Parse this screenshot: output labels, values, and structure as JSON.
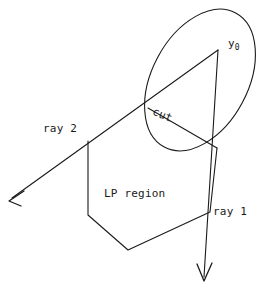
{
  "figure": {
    "background_color": "#ffffff",
    "ink_color": "#1a1a1a",
    "width": 273,
    "height": 292,
    "labels": {
      "y0_base": "y",
      "y0_subscript": "0",
      "cut": "cut",
      "ray2": "ray 2",
      "ray1": "ray 1",
      "lp_region": "LP region"
    },
    "geometry": {
      "ellipse": {
        "center_x": 200,
        "center_y": 80,
        "radius_x": 48,
        "radius_y": 76,
        "rotation_deg": 28
      },
      "apex_point": {
        "x": 218,
        "y": 50
      },
      "cut_left_point": {
        "x": 148,
        "y": 108
      },
      "cut_right_point": {
        "x": 217,
        "y": 148
      },
      "ray1": {
        "start_x": 218,
        "start_y": 50,
        "end_x": 204,
        "end_y": 281,
        "arrow": "down"
      },
      "ray2": {
        "start_x": 218,
        "start_y": 50,
        "end_x": 9,
        "end_y": 201,
        "arrow": "down-left"
      },
      "lp_region_polygon": [
        {
          "x": 88,
          "y": 141
        },
        {
          "x": 88,
          "y": 215
        },
        {
          "x": 128,
          "y": 250
        },
        {
          "x": 210,
          "y": 212
        },
        {
          "x": 217,
          "y": 148
        }
      ]
    }
  }
}
